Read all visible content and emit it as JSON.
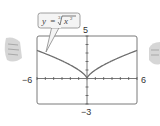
{
  "chart_data": {
    "type": "line",
    "title": "",
    "annotation": "y = ∛(x²)",
    "annotation_parts": {
      "lhs": "y",
      "eq": "=",
      "index": "3",
      "radicand_base": "x",
      "radicand_exp": "2"
    },
    "xlabel": "",
    "ylabel": "",
    "xlim": [
      -6,
      6
    ],
    "ylim": [
      -3,
      5
    ],
    "x_tick_step": 1,
    "y_tick_step": 1,
    "window_labels": {
      "xmin": "−6",
      "xmax": "6",
      "ymin": "−3",
      "ymax": "5"
    },
    "grid": false,
    "legend": "none",
    "series": [
      {
        "name": "y = x^(2/3)",
        "x": [
          -6,
          -5,
          -4,
          -3,
          -2,
          -1,
          -0.5,
          0,
          0.5,
          1,
          2,
          3,
          4,
          5,
          6
        ],
        "y": [
          3.3,
          2.92,
          2.52,
          2.08,
          1.59,
          1.0,
          0.63,
          0,
          0.63,
          1.0,
          1.59,
          2.08,
          2.52,
          2.92,
          3.3
        ]
      }
    ]
  },
  "colors": {
    "frame": "#777777",
    "curve": "#6e6e6e",
    "axes": "#555555",
    "callout_border": "#888888",
    "callout_fill": "#f4f4f4",
    "hand": "#b5b5b5"
  }
}
